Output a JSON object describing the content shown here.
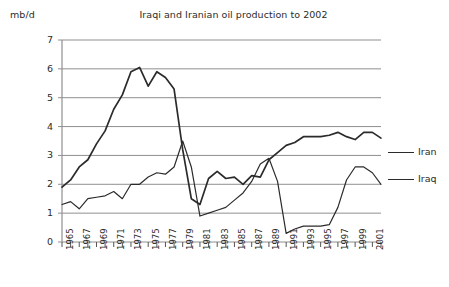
{
  "chart_data": {
    "type": "line",
    "title": "Iraqi and Iranian oil production to 2002",
    "xlabel": "",
    "ylabel": "mb/d",
    "ylim": [
      0,
      7
    ],
    "xlim": [
      1965,
      2002
    ],
    "grid": true,
    "legend_position": "right",
    "ytick_labels": [
      "0",
      "1",
      "2",
      "3",
      "4",
      "5",
      "6",
      "7"
    ],
    "ytick_values": [
      0,
      1,
      2,
      3,
      4,
      5,
      6,
      7
    ],
    "x": [
      1965,
      1966,
      1967,
      1968,
      1969,
      1970,
      1971,
      1972,
      1973,
      1974,
      1975,
      1976,
      1977,
      1978,
      1979,
      1980,
      1981,
      1982,
      1983,
      1984,
      1985,
      1986,
      1987,
      1988,
      1989,
      1990,
      1991,
      1992,
      1993,
      1994,
      1995,
      1996,
      1997,
      1998,
      1999,
      2000,
      2001,
      2002
    ],
    "xtick_labels": [
      "1965",
      "1967",
      "1969",
      "1971",
      "1973",
      "1975",
      "1977",
      "1979",
      "1981",
      "1983",
      "1985",
      "1987",
      "1989",
      "1991",
      "1993",
      "1995",
      "1997",
      "1999",
      "2001"
    ],
    "xtick_values": [
      1965,
      1967,
      1969,
      1971,
      1973,
      1975,
      1977,
      1979,
      1981,
      1983,
      1985,
      1987,
      1989,
      1991,
      1993,
      1995,
      1997,
      1999,
      2001
    ],
    "series": [
      {
        "name": "Iran",
        "color": "#2b2b2b",
        "values": [
          1.9,
          2.15,
          2.6,
          2.85,
          3.4,
          3.85,
          4.6,
          5.1,
          5.9,
          6.05,
          5.4,
          5.9,
          5.7,
          5.3,
          3.2,
          1.5,
          1.3,
          2.2,
          2.45,
          2.2,
          2.25,
          2.0,
          2.3,
          2.25,
          2.85,
          3.1,
          3.35,
          3.45,
          3.65,
          3.65,
          3.65,
          3.7,
          3.8,
          3.65,
          3.55,
          3.8,
          3.8,
          3.6
        ]
      },
      {
        "name": "Iraq",
        "color": "#2b2b2b",
        "values": [
          1.3,
          1.4,
          1.15,
          1.5,
          1.55,
          1.6,
          1.75,
          1.5,
          2.0,
          2.0,
          2.25,
          2.4,
          2.35,
          2.6,
          3.5,
          2.6,
          0.9,
          1.0,
          1.1,
          1.2,
          1.45,
          1.7,
          2.1,
          2.7,
          2.9,
          2.1,
          0.3,
          0.45,
          0.55,
          0.55,
          0.55,
          0.6,
          1.2,
          2.15,
          2.6,
          2.6,
          2.4,
          2.0
        ]
      }
    ]
  },
  "legend": {
    "items": [
      {
        "label": "Iran"
      },
      {
        "label": "Iraq"
      }
    ]
  }
}
